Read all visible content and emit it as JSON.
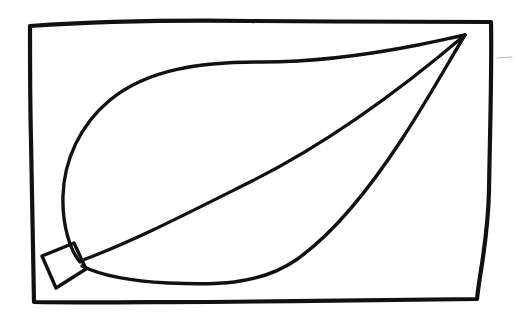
{
  "image": {
    "title": "Hand-drawn leaf line drawing",
    "medium": "black ink on white paper",
    "background_color": "#ffffff",
    "ink_color": "#111111",
    "width": 519,
    "height": 313
  },
  "frame": {
    "name": "hand-drawn rectangular border",
    "stroke_color": "#111111",
    "stroke_width": 4.2,
    "corners": {
      "top_left": [
        30,
        24
      ],
      "top_right": [
        492,
        22
      ],
      "bottom_right": [
        477,
        300
      ],
      "bottom_left": [
        33,
        302
      ]
    },
    "path": "M 30,26 C 90,22 170,20 250,21 C 330,22 420,21 491,22 C 492,70 490,130 489,190 C 488,240 480,270 477,299 C 400,300 300,301 210,302 C 150,302 80,303 34,302 C 33,250 32,190 31,140 C 30,100 30,60 30,26 Z"
  },
  "leaf": {
    "name": "leaf outline",
    "tip": [
      465,
      35
    ],
    "base": [
      80,
      262
    ],
    "leftmost": [
      62,
      190
    ],
    "top_of_curve": [
      278,
      63
    ],
    "bottom_of_curve": [
      178,
      283
    ],
    "upper_edge_path": "M 80,262 C 70,250 62,225 63,196 C 64,160 80,125 110,100 C 148,69 200,62 262,62 C 315,62 372,54 418,45 C 438,41 455,37 465,35",
    "lower_edge_path": "M 465,35 C 452,56 430,96 402,139 C 372,185 336,232 296,260 C 258,286 212,285 168,283 C 130,281 100,275 82,266",
    "midrib_path": "M 80,261 C 130,243 190,212 252,181 C 318,148 392,97 465,35"
  },
  "stem": {
    "name": "leaf stem (petiole)",
    "shape": "quadrilateral",
    "path": "M 74,243 L 86,269 L 56,288 L 42,256 Z",
    "stroke_width": 3.4
  },
  "marks": {
    "faint_smudge": {
      "name": "faint pencil smudge right of frame",
      "path": "M 497,58 L 512,57",
      "color": "#b9b9b9"
    }
  },
  "accessibility": {
    "alt_text": "A simple black ink line drawing of a leaf with a prominent midrib and a short rectangular stem, enclosed in a hand-drawn rectangular border."
  }
}
